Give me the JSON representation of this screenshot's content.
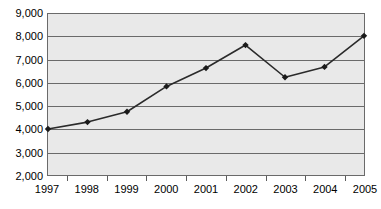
{
  "chart_data": {
    "type": "line",
    "title": "",
    "subtitle": "",
    "xlabel": "",
    "ylabel": "",
    "categories": [
      "1997",
      "1998",
      "1999",
      "2000",
      "2001",
      "2002",
      "2003",
      "2004",
      "2005"
    ],
    "values": [
      4000,
      4300,
      4750,
      5850,
      6650,
      7650,
      6250,
      6700,
      8050
    ],
    "series": [
      {
        "name": "",
        "values": [
          4000,
          4300,
          4750,
          5850,
          6650,
          7650,
          6250,
          6700,
          8050
        ]
      }
    ],
    "ylim": [
      2000,
      9000
    ],
    "ytick_labels": [
      "9,000",
      "8,000",
      "7,000",
      "6,000",
      "5,000",
      "4,000",
      "3,000",
      "2,000"
    ],
    "ytick_values": [
      9000,
      8000,
      7000,
      6000,
      5000,
      4000,
      3000,
      2000
    ],
    "xtick_labels": [
      "1997",
      "1998",
      "1999",
      "2000",
      "2001",
      "2002",
      "2003",
      "2004",
      "2005"
    ],
    "grid": true,
    "grid_axis": "y",
    "legend": false,
    "legend_position": "none",
    "annotations": [],
    "marker": "diamond",
    "colors": {
      "line": "#2b2b2b",
      "marker": "#1a1a1a",
      "plot_background": "#e9e9e9",
      "gridline": "#6a6a6a",
      "border": "#6a6a6a",
      "page_background": "#ffffff",
      "text": "#000000"
    }
  }
}
